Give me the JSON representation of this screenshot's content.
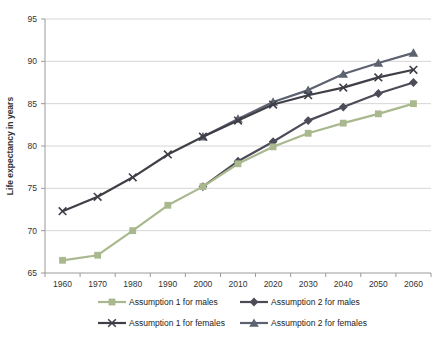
{
  "chart_data": {
    "type": "line",
    "title": "",
    "xlabel": "",
    "ylabel": "Life expectancy in years",
    "ylim": [
      65,
      95
    ],
    "yticks": [
      65,
      70,
      75,
      80,
      85,
      90,
      95
    ],
    "grid": "horizontal",
    "legend_position": "bottom-two-columns",
    "categories": [
      "1960",
      "1970",
      "1980",
      "1990",
      "2000",
      "2010",
      "2020",
      "2030",
      "2040",
      "2050",
      "2060"
    ],
    "series": [
      {
        "name": "Assumption 1 for males",
        "marker": "square",
        "color": "#A9B88E",
        "values": [
          66.5,
          67.1,
          70.0,
          73.0,
          75.2,
          77.9,
          79.9,
          81.5,
          82.7,
          83.8,
          85.0
        ]
      },
      {
        "name": "Assumption 2 for males",
        "marker": "diamond",
        "color": "#4C4C58",
        "values": [
          null,
          null,
          null,
          null,
          75.2,
          78.2,
          80.5,
          83.0,
          84.6,
          86.2,
          87.5
        ]
      },
      {
        "name": "Assumption 1 for females",
        "marker": "x",
        "color": "#3F3F47",
        "values": [
          72.3,
          74.0,
          76.3,
          79.0,
          81.1,
          83.0,
          84.9,
          86.0,
          86.9,
          88.1,
          89.0
        ]
      },
      {
        "name": "Assumption 2 for females",
        "marker": "triangle",
        "color": "#5D6271",
        "values": [
          null,
          null,
          null,
          null,
          81.1,
          83.2,
          85.2,
          86.6,
          88.5,
          89.8,
          91.0
        ]
      }
    ],
    "legend_rows": [
      [
        0,
        1
      ],
      [
        2,
        3
      ]
    ]
  },
  "style": {
    "gridline_color": "#D6D6D6",
    "axis_color": "#9A9A9A",
    "tick_text_color": "#333333",
    "legend_text_color": "#222222"
  }
}
